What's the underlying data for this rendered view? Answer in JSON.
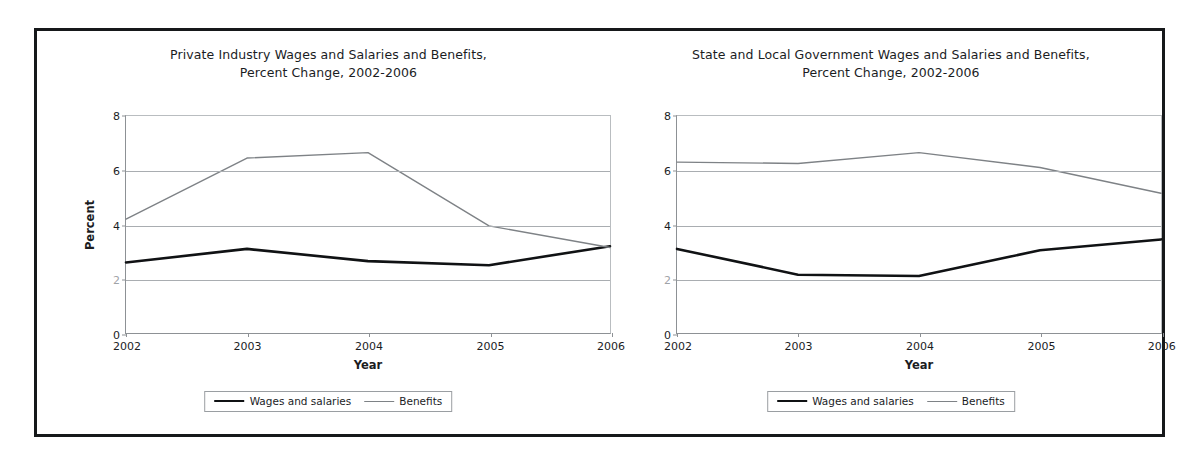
{
  "charts": [
    {
      "id": "private",
      "title_lines": [
        "Private Industry Wages and Salaries and Benefits,",
        "Percent Change, 2002-2006"
      ],
      "xlabel": "Year",
      "ylabel": "Percent",
      "yticks": [
        "8",
        "6",
        "4",
        "2",
        "0"
      ],
      "xticks": [
        "2002",
        "2003",
        "2004",
        "2005",
        "2006"
      ],
      "legend": [
        {
          "name": "Wages and salaries",
          "style": "wages"
        },
        {
          "name": "Benefits",
          "style": "benefits"
        }
      ]
    },
    {
      "id": "stlocal",
      "title_lines": [
        "State and Local Government Wages and Salaries and Benefits,",
        "Percent Change, 2002-2006"
      ],
      "xlabel": "Year",
      "ylabel": "",
      "yticks": [
        "8",
        "6",
        "4",
        "2",
        "0"
      ],
      "xticks": [
        "2002",
        "2003",
        "2004",
        "2005",
        "2006"
      ],
      "legend": [
        {
          "name": "Wages and salaries",
          "style": "wages"
        },
        {
          "name": "Benefits",
          "style": "benefits"
        }
      ]
    }
  ],
  "chart_data": [
    {
      "type": "line",
      "id": "private",
      "title": "Private Industry Wages and Salaries and Benefits, Percent Change, 2002-2006",
      "xlabel": "Year",
      "ylabel": "Percent",
      "x": [
        2002,
        2003,
        2004,
        2005,
        2006
      ],
      "categories": [
        "2002",
        "2003",
        "2004",
        "2005",
        "2006"
      ],
      "series": [
        {
          "name": "Wages and salaries",
          "values": [
            2.6,
            3.1,
            2.65,
            2.5,
            3.2
          ],
          "color": "#101214",
          "width": 2.6
        },
        {
          "name": "Benefits",
          "values": [
            4.2,
            6.45,
            6.65,
            3.95,
            3.15
          ],
          "color": "#7e8286",
          "width": 1.4
        }
      ],
      "ylim": [
        0,
        8
      ],
      "yticks": [
        8,
        6,
        4,
        2,
        0
      ],
      "grid": true,
      "legend_position": "bottom"
    },
    {
      "type": "line",
      "id": "stlocal",
      "title": "State and Local Government Wages and Salaries and Benefits, Percent Change, 2002-2006",
      "xlabel": "Year",
      "ylabel": "",
      "x": [
        2002,
        2003,
        2004,
        2005,
        2006
      ],
      "categories": [
        "2002",
        "2003",
        "2004",
        "2005",
        "2006"
      ],
      "series": [
        {
          "name": "Wages and salaries",
          "values": [
            3.1,
            2.15,
            2.1,
            3.05,
            3.45
          ],
          "color": "#101214",
          "width": 2.6
        },
        {
          "name": "Benefits",
          "values": [
            6.3,
            6.25,
            6.65,
            6.1,
            5.15
          ],
          "color": "#7e8286",
          "width": 1.4
        }
      ],
      "ylim": [
        0,
        8
      ],
      "yticks": [
        8,
        6,
        4,
        2,
        0
      ],
      "grid": true,
      "legend_position": "bottom"
    }
  ]
}
